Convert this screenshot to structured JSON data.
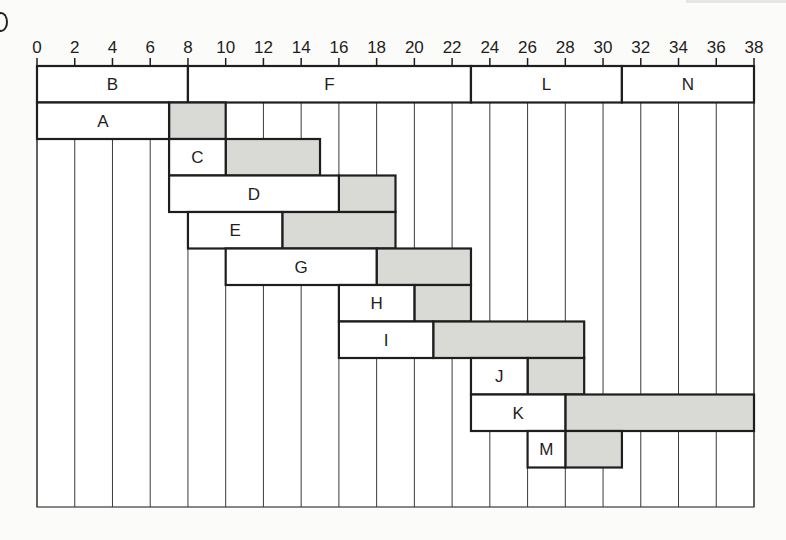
{
  "chart_data": {
    "type": "gantt",
    "title": "",
    "xlabel": "",
    "ylabel": "",
    "x_ticks": [
      0,
      2,
      4,
      6,
      8,
      10,
      12,
      14,
      16,
      18,
      20,
      22,
      24,
      26,
      28,
      30,
      32,
      34,
      36,
      38
    ],
    "xlim": [
      0,
      38
    ],
    "grid": "vertical lines every 2 units",
    "legend": [
      {
        "name": "activity duration",
        "color": "#ffffff"
      },
      {
        "name": "slack / float",
        "color": "#d9d9d6"
      }
    ],
    "critical_path": [
      {
        "label": "B",
        "start": 0,
        "end": 8
      },
      {
        "label": "F",
        "start": 8,
        "end": 23
      },
      {
        "label": "L",
        "start": 23,
        "end": 31
      },
      {
        "label": "N",
        "start": 31,
        "end": 38
      }
    ],
    "tasks": [
      {
        "label": "A",
        "start": 0,
        "end": 7,
        "slack_end": 10
      },
      {
        "label": "C",
        "start": 7,
        "end": 10,
        "slack_end": 15
      },
      {
        "label": "D",
        "start": 7,
        "end": 16,
        "slack_end": 19
      },
      {
        "label": "E",
        "start": 8,
        "end": 13,
        "slack_end": 19
      },
      {
        "label": "G",
        "start": 10,
        "end": 18,
        "slack_end": 23
      },
      {
        "label": "H",
        "start": 16,
        "end": 20,
        "slack_end": 23
      },
      {
        "label": "I",
        "start": 16,
        "end": 21,
        "slack_end": 29
      },
      {
        "label": "J",
        "start": 23,
        "end": 26,
        "slack_end": 29
      },
      {
        "label": "K",
        "start": 23,
        "end": 28,
        "slack_end": 38
      },
      {
        "label": "M",
        "start": 26,
        "end": 28,
        "slack_end": 31
      }
    ]
  },
  "colors": {
    "activity": "#ffffff",
    "slack": "#d9d9d6",
    "stroke": "#1e1e1e",
    "grid": "#3a3a3a",
    "background": "#fbfbf9"
  }
}
